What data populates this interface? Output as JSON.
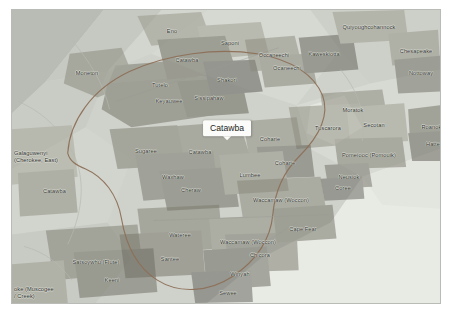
{
  "map": {
    "title": "Catawba",
    "background_color": "#cfd2cb",
    "frame_color": "#ffffff",
    "border_color": "#b9bcb6",
    "water_color": "#e8eae4",
    "selected_region": "Catawba",
    "tooltip": {
      "label": "Catawba",
      "x": 215,
      "y": 118
    },
    "highlight_outline_color": "#8d6f57",
    "territories": [
      {
        "name": "Moneton",
        "x": 75,
        "y": 63,
        "size": "sm"
      },
      {
        "name": "Tutelo",
        "x": 148,
        "y": 75,
        "size": "sm"
      },
      {
        "name": "Keyauwee",
        "x": 157,
        "y": 91,
        "size": "sm"
      },
      {
        "name": "Eno",
        "x": 160,
        "y": 21,
        "size": "sm"
      },
      {
        "name": "Saponi",
        "x": 218,
        "y": 33,
        "size": "sm"
      },
      {
        "name": "Catawba",
        "x": 175,
        "y": 50,
        "size": "sm"
      },
      {
        "name": "Sissipahaw",
        "x": 197,
        "y": 88,
        "size": "sm"
      },
      {
        "name": "Shakori",
        "x": 215,
        "y": 70,
        "size": "sm"
      },
      {
        "name": "Occaneechi",
        "x": 262,
        "y": 45,
        "size": "sm"
      },
      {
        "name": "Ocaneechi",
        "x": 275,
        "y": 58,
        "size": "sm"
      },
      {
        "name": "Kaweskiotta",
        "x": 312,
        "y": 44,
        "size": "sm"
      },
      {
        "name": "Quiyoughcohannock",
        "x": 357,
        "y": 17,
        "size": "sm"
      },
      {
        "name": "Chesapeake",
        "x": 404,
        "y": 41,
        "size": "sm"
      },
      {
        "name": "Nottoway",
        "x": 409,
        "y": 63,
        "size": "sm"
      },
      {
        "name": "Moratok",
        "x": 341,
        "y": 100,
        "size": "sm"
      },
      {
        "name": "Tuscarora",
        "x": 316,
        "y": 118,
        "size": "sm"
      },
      {
        "name": "Secotan",
        "x": 362,
        "y": 115,
        "size": "sm"
      },
      {
        "name": "Roanoke",
        "x": 421,
        "y": 117,
        "size": "sm"
      },
      {
        "name": "Hatteras",
        "x": 425,
        "y": 134,
        "size": "sm"
      },
      {
        "name": "Pomeiooc (Pomouik)",
        "x": 357,
        "y": 145,
        "size": "sm"
      },
      {
        "name": "Neusiok",
        "x": 337,
        "y": 167,
        "size": "sm"
      },
      {
        "name": "Coree",
        "x": 331,
        "y": 178,
        "size": "sm"
      },
      {
        "name": "Coharie",
        "x": 258,
        "y": 129,
        "size": "sm"
      },
      {
        "name": "Coharie",
        "x": 273,
        "y": 153,
        "size": "sm"
      },
      {
        "name": "Catawba",
        "x": 188,
        "y": 142,
        "size": "sm"
      },
      {
        "name": "Sugaree",
        "x": 134,
        "y": 141,
        "size": "sm"
      },
      {
        "name": "Waxhaw",
        "x": 161,
        "y": 167,
        "size": "sm"
      },
      {
        "name": "Cheraw",
        "x": 179,
        "y": 180,
        "size": "sm"
      },
      {
        "name": "Lumbee",
        "x": 238,
        "y": 165,
        "size": "sm"
      },
      {
        "name": "Waccamaw (Woccon)",
        "x": 269,
        "y": 190,
        "size": "sm"
      },
      {
        "name": "Wateree",
        "x": 168,
        "y": 225,
        "size": "sm"
      },
      {
        "name": "Santee",
        "x": 158,
        "y": 249,
        "size": "sm"
      },
      {
        "name": "Waccamaw (Woccon)",
        "x": 236,
        "y": 232,
        "size": "sm"
      },
      {
        "name": "Chicora",
        "x": 248,
        "y": 245,
        "size": "sm"
      },
      {
        "name": "Cape Fear",
        "x": 291,
        "y": 219,
        "size": "sm"
      },
      {
        "name": "Winyah",
        "x": 228,
        "y": 264,
        "size": "sm"
      },
      {
        "name": "Sewee",
        "x": 216,
        "y": 283,
        "size": "sm"
      },
      {
        "name": "Satsoywhu (Flute)",
        "x": 84,
        "y": 252,
        "size": "sm"
      },
      {
        "name": "Keeni",
        "x": 100,
        "y": 270,
        "size": "sm"
      }
    ],
    "edge_labels": [
      {
        "name": "Galaguwenyi\n(Cherokee, East)",
        "x": 2,
        "y": 147,
        "size": "sm"
      },
      {
        "name": "Catawba",
        "x": 31,
        "y": 181,
        "size": "sm"
      },
      {
        "name": "oke (Muscogee\n/ Creek)",
        "x": 2,
        "y": 283,
        "size": "sm"
      }
    ]
  }
}
